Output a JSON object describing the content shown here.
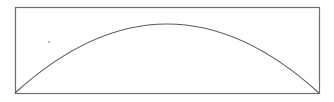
{
  "diagram": {
    "frame": {
      "x": 15,
      "y": 7,
      "width": 304,
      "height": 86,
      "stroke": "#6e6e6e"
    },
    "arc": {
      "start": [
        15,
        93
      ],
      "peak": [
        167,
        24
      ],
      "end": [
        319,
        93
      ],
      "stroke": "#5a5a5a"
    },
    "dot": {
      "x": 49,
      "y": 42,
      "r": 0.9,
      "fill": "#9a9a9a"
    }
  }
}
